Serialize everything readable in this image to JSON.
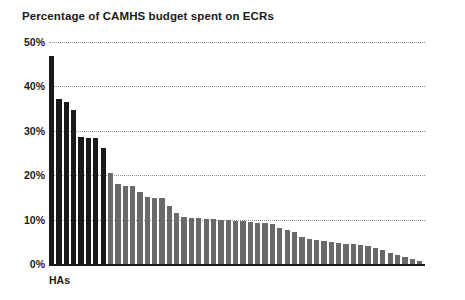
{
  "chart": {
    "title": "Percentage of CAMHS budget spent on ECRs",
    "xlabel": "HAs",
    "ylabel": ""
  },
  "axis": {
    "ticks": [
      "50%",
      "40%",
      "30%",
      "20%",
      "10%",
      "0%"
    ],
    "tick_values": [
      50,
      40,
      30,
      20,
      10,
      0
    ]
  },
  "colors": {
    "bar_dark": "#1a1a1a",
    "bar_light": "#6a6a6a",
    "gridline": "#8c8c8c",
    "text": "#1a1a1a",
    "background": "#ffffff"
  },
  "chart_data": {
    "type": "bar",
    "title": "Percentage of CAMHS budget spent on ECRs",
    "xlabel": "HAs",
    "ylabel": "",
    "ylim": [
      0,
      50
    ],
    "yticks": [
      0,
      10,
      20,
      30,
      40,
      50
    ],
    "ytick_labels": [
      "0%",
      "10%",
      "20%",
      "30%",
      "40%",
      "50%"
    ],
    "grid": true,
    "grid_style": "dotted horizontal",
    "legend": "none",
    "units": "percent",
    "sorted": "descending",
    "highlight_note": "first 8 bars drawn in black, remaining bars in grey",
    "dark_bar_count": 8,
    "categories": [
      "HA1",
      "HA2",
      "HA3",
      "HA4",
      "HA5",
      "HA6",
      "HA7",
      "HA8",
      "HA9",
      "HA10",
      "HA11",
      "HA12",
      "HA13",
      "HA14",
      "HA15",
      "HA16",
      "HA17",
      "HA18",
      "HA19",
      "HA20",
      "HA21",
      "HA22",
      "HA23",
      "HA24",
      "HA25",
      "HA26",
      "HA27",
      "HA28",
      "HA29",
      "HA30",
      "HA31",
      "HA32",
      "HA33",
      "HA34",
      "HA35",
      "HA36",
      "HA37",
      "HA38",
      "HA39",
      "HA40",
      "HA41",
      "HA42",
      "HA43",
      "HA44",
      "HA45",
      "HA46",
      "HA47",
      "HA48",
      "HA49",
      "HA50",
      "HA51"
    ],
    "values": [
      46.8,
      37.2,
      36.5,
      34.7,
      28.5,
      28.4,
      28.3,
      26.1,
      20.6,
      18.0,
      17.6,
      17.5,
      16.3,
      15.0,
      14.9,
      14.8,
      13.0,
      11.6,
      10.6,
      10.4,
      10.3,
      10.2,
      10.1,
      10.0,
      9.9,
      9.8,
      9.6,
      9.4,
      9.3,
      9.2,
      9.0,
      8.0,
      7.6,
      7.2,
      6.0,
      5.6,
      5.4,
      5.2,
      5.0,
      4.8,
      4.6,
      4.4,
      4.2,
      4.0,
      3.6,
      3.2,
      2.4,
      2.0,
      1.6,
      1.2,
      0.6
    ],
    "colors": [
      "#1a1a1a",
      "#1a1a1a",
      "#1a1a1a",
      "#1a1a1a",
      "#1a1a1a",
      "#1a1a1a",
      "#1a1a1a",
      "#1a1a1a",
      "#6a6a6a",
      "#6a6a6a",
      "#6a6a6a",
      "#6a6a6a",
      "#6a6a6a",
      "#6a6a6a",
      "#6a6a6a",
      "#6a6a6a",
      "#6a6a6a",
      "#6a6a6a",
      "#6a6a6a",
      "#6a6a6a",
      "#6a6a6a",
      "#6a6a6a",
      "#6a6a6a",
      "#6a6a6a",
      "#6a6a6a",
      "#6a6a6a",
      "#6a6a6a",
      "#6a6a6a",
      "#6a6a6a",
      "#6a6a6a",
      "#6a6a6a",
      "#6a6a6a",
      "#6a6a6a",
      "#6a6a6a",
      "#6a6a6a",
      "#6a6a6a",
      "#6a6a6a",
      "#6a6a6a",
      "#6a6a6a",
      "#6a6a6a",
      "#6a6a6a",
      "#6a6a6a",
      "#6a6a6a",
      "#6a6a6a",
      "#6a6a6a",
      "#6a6a6a",
      "#6a6a6a",
      "#6a6a6a",
      "#6a6a6a",
      "#6a6a6a",
      "#6a6a6a"
    ]
  }
}
